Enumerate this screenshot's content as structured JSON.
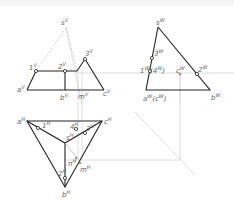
{
  "diagram": {
    "type": "orthographic-projection",
    "views": {
      "front_v": {
        "labels": [
          "s",
          "1",
          "2",
          "3",
          "a",
          "b",
          "c",
          "m"
        ],
        "superscript": "V"
      },
      "side_w": {
        "labels": [
          "s",
          "3",
          "1(4)",
          "2",
          "c",
          "a(c)",
          "b"
        ],
        "superscript": "W"
      },
      "top_h": {
        "labels": [
          "a",
          "1",
          "4",
          "3",
          "s",
          "c",
          "2",
          "n",
          "m",
          "b"
        ],
        "superscript": "H"
      }
    },
    "colors": {
      "solid_line": "#222222",
      "hidden_line": "#bbbbbb",
      "construction_line": "#cccccc",
      "label": "#666666"
    }
  }
}
